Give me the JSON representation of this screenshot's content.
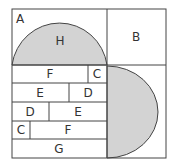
{
  "diagram": {
    "colors": {
      "stroke": "#444444",
      "fill_shaded": "#d3d3d3",
      "background": "#ffffff"
    },
    "regions": {
      "A": "A",
      "H": "H",
      "B": "B"
    },
    "rows": [
      {
        "left": "F",
        "right": "C"
      },
      {
        "left": "E",
        "right": "D"
      },
      {
        "left": "D",
        "right": "E"
      },
      {
        "left": "C",
        "right": "F"
      },
      {
        "full": "G"
      }
    ]
  }
}
